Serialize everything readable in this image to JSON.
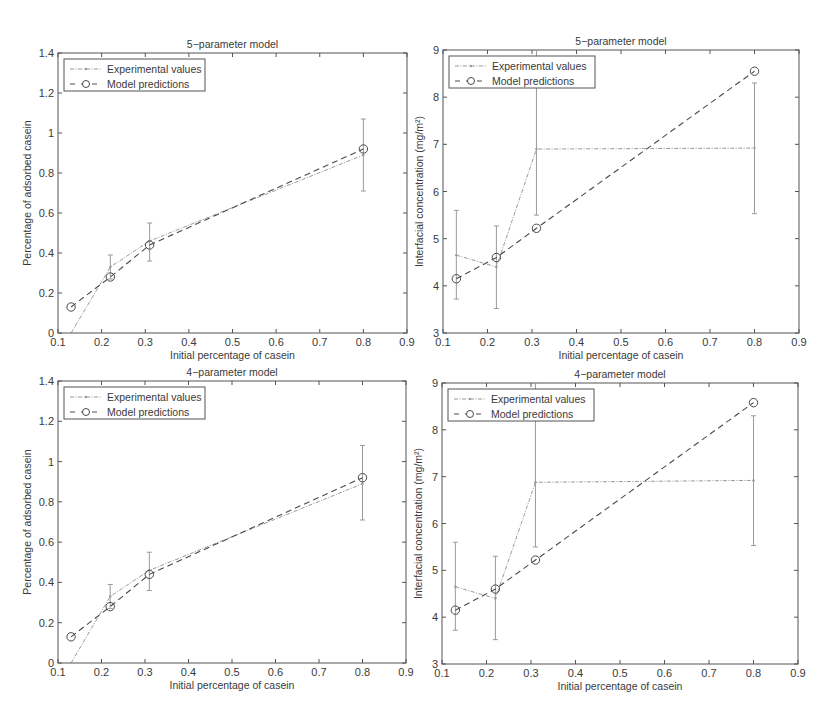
{
  "figure": {
    "panels": [
      {
        "id": "top-left",
        "title": "5−parameter model"
      },
      {
        "id": "top-right",
        "title": "5−parameter model"
      },
      {
        "id": "bottom-left",
        "title": "4−parameter model"
      },
      {
        "id": "bottom-right",
        "title": "4−parameter model"
      }
    ],
    "legend": {
      "experimental": "Experimental values",
      "model": "Model predictions"
    },
    "xlabel": "Initial percentage of casein",
    "ylabel_left": "Percentage of adsorbed casein",
    "ylabel_right": "Interfacial concentration (mg/m²)"
  },
  "chart_data": [
    {
      "type": "line",
      "title": "5-parameter model",
      "xlabel": "Initial percentage of casein",
      "ylabel": "Percentage of adsorbed casein",
      "xlim": [
        0.1,
        0.9
      ],
      "ylim": [
        0,
        1.4
      ],
      "xticks": [
        "0.1",
        "0.2",
        "0.3",
        "0.4",
        "0.5",
        "0.6",
        "0.7",
        "0.8",
        "0.9"
      ],
      "yticks": [
        "0",
        "0.2",
        "0.4",
        "0.6",
        "0.8",
        "1",
        "1.2",
        "1.4"
      ],
      "legend_position": "upper left",
      "grid": false,
      "x": [
        0.13,
        0.22,
        0.31,
        0.8
      ],
      "series": [
        {
          "name": "Experimental values",
          "style": "dotted line with point markers and error bars",
          "values": [
            0.0,
            0.33,
            0.46,
            0.89
          ],
          "error_low": [
            null,
            0.27,
            0.36,
            0.71
          ],
          "error_high": [
            null,
            0.39,
            0.55,
            1.07
          ]
        },
        {
          "name": "Model predictions",
          "style": "dashed line with circle markers",
          "values": [
            0.13,
            0.28,
            0.44,
            0.92
          ]
        }
      ]
    },
    {
      "type": "line",
      "title": "5-parameter model",
      "xlabel": "Initial percentage of casein",
      "ylabel": "Interfacial concentration (mg/m²)",
      "xlim": [
        0.1,
        0.9
      ],
      "ylim": [
        3,
        9
      ],
      "xticks": [
        "0.1",
        "0.2",
        "0.3",
        "0.4",
        "0.5",
        "0.6",
        "0.7",
        "0.8",
        "0.9"
      ],
      "yticks": [
        "3",
        "4",
        "5",
        "6",
        "7",
        "8",
        "9"
      ],
      "legend_position": "upper left",
      "grid": false,
      "x": [
        0.13,
        0.22,
        0.31,
        0.8
      ],
      "series": [
        {
          "name": "Experimental values",
          "style": "dotted line with point markers and error bars",
          "values": [
            4.65,
            4.4,
            6.9,
            6.92
          ],
          "error_low": [
            3.72,
            3.52,
            5.5,
            5.53
          ],
          "error_high": [
            5.6,
            5.27,
            9.0,
            8.3
          ]
        },
        {
          "name": "Model predictions",
          "style": "dashed line with circle markers",
          "values": [
            4.15,
            4.6,
            5.22,
            8.55
          ]
        }
      ]
    },
    {
      "type": "line",
      "title": "4-parameter model",
      "xlabel": "Initial percentage of casein",
      "ylabel": "Percentage of adsorbed casein",
      "xlim": [
        0.1,
        0.9
      ],
      "ylim": [
        0,
        1.4
      ],
      "xticks": [
        "0.1",
        "0.2",
        "0.3",
        "0.4",
        "0.5",
        "0.6",
        "0.7",
        "0.8",
        "0.9"
      ],
      "yticks": [
        "0",
        "0.2",
        "0.4",
        "0.6",
        "0.8",
        "1",
        "1.2",
        "1.4"
      ],
      "legend_position": "upper left",
      "grid": false,
      "x": [
        0.13,
        0.22,
        0.31,
        0.8
      ],
      "series": [
        {
          "name": "Experimental values",
          "style": "dotted line with point markers and error bars",
          "values": [
            0.0,
            0.33,
            0.46,
            0.89
          ],
          "error_low": [
            null,
            0.27,
            0.36,
            0.71
          ],
          "error_high": [
            null,
            0.39,
            0.55,
            1.08
          ]
        },
        {
          "name": "Model predictions",
          "style": "dashed line with circle markers",
          "values": [
            0.13,
            0.28,
            0.44,
            0.92
          ]
        }
      ]
    },
    {
      "type": "line",
      "title": "4-parameter model",
      "xlabel": "Initial percentage of casein",
      "ylabel": "Interfacial concentration (mg/m²)",
      "xlim": [
        0.1,
        0.9
      ],
      "ylim": [
        3,
        9
      ],
      "xticks": [
        "0.1",
        "0.2",
        "0.3",
        "0.4",
        "0.5",
        "0.6",
        "0.7",
        "0.8",
        "0.9"
      ],
      "yticks": [
        "3",
        "4",
        "5",
        "6",
        "7",
        "8",
        "9"
      ],
      "legend_position": "upper left",
      "grid": false,
      "x": [
        0.13,
        0.22,
        0.31,
        0.8
      ],
      "series": [
        {
          "name": "Experimental values",
          "style": "dotted line with point markers and error bars",
          "values": [
            4.65,
            4.4,
            6.88,
            6.92
          ],
          "error_low": [
            3.72,
            3.52,
            5.5,
            5.53
          ],
          "error_high": [
            5.6,
            5.3,
            9.0,
            8.3
          ]
        },
        {
          "name": "Model predictions",
          "style": "dashed line with circle markers",
          "values": [
            4.15,
            4.6,
            5.22,
            8.58
          ]
        }
      ]
    }
  ],
  "layout": {
    "panels": [
      {
        "left": 58,
        "top": 53,
        "right": 407,
        "bottom": 333
      },
      {
        "left": 443,
        "top": 50,
        "right": 799,
        "bottom": 333
      },
      {
        "left": 58,
        "top": 381,
        "right": 406,
        "bottom": 663
      },
      {
        "left": 442,
        "top": 383,
        "right": 798,
        "bottom": 664
      }
    ],
    "colors": {
      "axis": "#555555",
      "experimental": "#9a9a9a",
      "model": "#4a4a4a",
      "text": "#3a3a3a"
    }
  }
}
